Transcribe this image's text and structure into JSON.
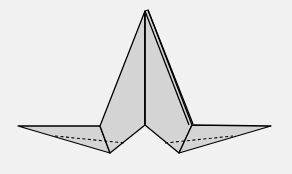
{
  "diagram": {
    "type": "origami-fold-diagram",
    "colors": {
      "background": "#f1f1f1",
      "paper_fill": "#d4d4d4",
      "outline": "#000000"
    },
    "line_styles": {
      "solid": "fold edge / outline",
      "dashed": "hidden edge"
    }
  }
}
